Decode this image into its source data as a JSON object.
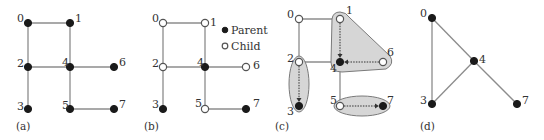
{
  "figure": {
    "panels": [
      {
        "id": "a",
        "caption": "(a)",
        "nodes": [
          {
            "id": "0",
            "label": "0",
            "x": 28,
            "y": 23,
            "type": "parent"
          },
          {
            "id": "1",
            "label": "1",
            "x": 70,
            "y": 23,
            "type": "parent"
          },
          {
            "id": "2",
            "label": "2",
            "x": 28,
            "y": 67,
            "type": "parent"
          },
          {
            "id": "4",
            "label": "4",
            "x": 70,
            "y": 67,
            "type": "parent"
          },
          {
            "id": "6",
            "label": "6",
            "x": 114,
            "y": 67,
            "type": "parent"
          },
          {
            "id": "3",
            "label": "3",
            "x": 28,
            "y": 109,
            "type": "parent"
          },
          {
            "id": "5",
            "label": "5",
            "x": 70,
            "y": 109,
            "type": "parent"
          },
          {
            "id": "7",
            "label": "7",
            "x": 114,
            "y": 109,
            "type": "parent"
          }
        ],
        "edges": [
          [
            "0",
            "1"
          ],
          [
            "0",
            "2"
          ],
          [
            "1",
            "4"
          ],
          [
            "2",
            "4"
          ],
          [
            "4",
            "6"
          ],
          [
            "2",
            "3"
          ],
          [
            "4",
            "5"
          ],
          [
            "5",
            "7"
          ]
        ]
      },
      {
        "id": "b",
        "caption": "(b)",
        "nodes": [
          {
            "id": "0",
            "label": "0",
            "x": 163,
            "y": 23,
            "type": "child"
          },
          {
            "id": "1",
            "label": "1",
            "x": 205,
            "y": 23,
            "type": "child"
          },
          {
            "id": "2",
            "label": "2",
            "x": 163,
            "y": 67,
            "type": "child"
          },
          {
            "id": "4",
            "label": "4",
            "x": 205,
            "y": 67,
            "type": "parent"
          },
          {
            "id": "6",
            "label": "6",
            "x": 246,
            "y": 67,
            "type": "child"
          },
          {
            "id": "3",
            "label": "3",
            "x": 163,
            "y": 109,
            "type": "parent"
          },
          {
            "id": "5",
            "label": "5",
            "x": 205,
            "y": 109,
            "type": "child"
          },
          {
            "id": "7",
            "label": "7",
            "x": 246,
            "y": 109,
            "type": "parent"
          }
        ],
        "edges": [
          [
            "0",
            "1"
          ],
          [
            "0",
            "2"
          ],
          [
            "1",
            "4"
          ],
          [
            "2",
            "4"
          ],
          [
            "4",
            "6"
          ],
          [
            "2",
            "3"
          ],
          [
            "4",
            "5"
          ],
          [
            "5",
            "7"
          ]
        ]
      },
      {
        "id": "c",
        "caption": "(c)",
        "nodes": [
          {
            "id": "0",
            "label": "0",
            "x": 299,
            "y": 19,
            "type": "child"
          },
          {
            "id": "1",
            "label": "1",
            "x": 340,
            "y": 19,
            "type": "child"
          },
          {
            "id": "2",
            "label": "2",
            "x": 299,
            "y": 62,
            "type": "child"
          },
          {
            "id": "4",
            "label": "4",
            "x": 340,
            "y": 62,
            "type": "parent"
          },
          {
            "id": "6",
            "label": "6",
            "x": 383,
            "y": 62,
            "type": "child"
          },
          {
            "id": "3",
            "label": "3",
            "x": 299,
            "y": 106,
            "type": "parent"
          },
          {
            "id": "5",
            "label": "5",
            "x": 340,
            "y": 106,
            "type": "child"
          },
          {
            "id": "7",
            "label": "7",
            "x": 383,
            "y": 106,
            "type": "parent"
          }
        ],
        "edges": [
          [
            "0",
            "1"
          ],
          [
            "0",
            "2"
          ],
          [
            "2",
            "4"
          ],
          [
            "4",
            "5"
          ]
        ],
        "clusters": [
          {
            "members": [
              "2",
              "3"
            ],
            "parent": "3"
          },
          {
            "members": [
              "1",
              "4",
              "6"
            ],
            "parent": "4"
          },
          {
            "members": [
              "5",
              "7"
            ],
            "parent": "7"
          }
        ],
        "arrows": [
          [
            "2",
            "3"
          ],
          [
            "1",
            "4"
          ],
          [
            "6",
            "4"
          ],
          [
            "5",
            "7"
          ]
        ]
      },
      {
        "id": "d",
        "caption": "(d)",
        "nodes": [
          {
            "id": "0",
            "label": "0",
            "x": 432,
            "y": 18,
            "type": "parent"
          },
          {
            "id": "4",
            "label": "4",
            "x": 474,
            "y": 61,
            "type": "parent"
          },
          {
            "id": "3",
            "label": "3",
            "x": 432,
            "y": 104,
            "type": "parent"
          },
          {
            "id": "7",
            "label": "7",
            "x": 517,
            "y": 104,
            "type": "parent"
          }
        ],
        "edges": [
          [
            "0",
            "3"
          ],
          [
            "0",
            "4"
          ],
          [
            "3",
            "4"
          ],
          [
            "4",
            "7"
          ]
        ]
      }
    ],
    "legend": {
      "parent_label": "Parent",
      "child_label": "Child"
    },
    "colors": {
      "parent_fill": "#1a1a1a",
      "child_fill": "#ffffff",
      "edge": "#8c8c8c",
      "cluster_fill": "#d6d6d6",
      "text": "#333333"
    }
  }
}
